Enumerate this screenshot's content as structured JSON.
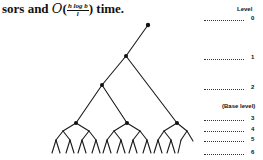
{
  "text": {
    "prefix": "sors and ",
    "bigO": "O",
    "open_paren": "(",
    "frac_num": "h log b",
    "frac_den": "l",
    "close": ") time."
  },
  "figure": {
    "level_header": "Level",
    "base_level_label": "(Base level)",
    "levels": [
      {
        "label": "0",
        "y": 19
      },
      {
        "label": "1",
        "y": 58
      },
      {
        "label": "2",
        "y": 88
      },
      {
        "label": "3",
        "y": 119
      },
      {
        "label": "4",
        "y": 130
      },
      {
        "label": "5",
        "y": 140
      },
      {
        "label": "6",
        "y": 153
      }
    ],
    "line_color": "#1a1a1a"
  }
}
